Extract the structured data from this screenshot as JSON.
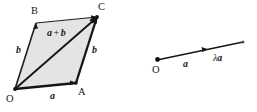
{
  "figure": {
    "colors": {
      "stroke": "#1a1a1a",
      "fill": "#e3e3e3",
      "background": "#ffffff"
    }
  },
  "parallelogram": {
    "name": "parallelogram-OACB",
    "vertices": [
      {
        "label": "O",
        "x": 15,
        "y": 89
      },
      {
        "label": "A",
        "x": 76,
        "y": 83
      },
      {
        "label": "C",
        "x": 97,
        "y": 17
      },
      {
        "label": "B",
        "x": 36,
        "y": 23
      }
    ],
    "vertex_labels": {
      "O": "O",
      "A": "A",
      "B": "B",
      "C": "C"
    },
    "edge_labels": {
      "bottom": "a",
      "left": "b",
      "right": "b",
      "diagonal": "a + b"
    },
    "diagonal_label_parts": {
      "first": "a",
      "operator": "+",
      "second": "b"
    }
  },
  "ray": {
    "name": "scalar-multiple-ray",
    "origin_label": "O",
    "origin": {
      "x": 157,
      "y": 60
    },
    "end": {
      "x": 243,
      "y": 42
    },
    "arrow_tip": {
      "x": 207,
      "y": 50
    },
    "labels": {
      "vector": "a",
      "scaled_prefix": "λ",
      "scaled_vector": "a"
    }
  }
}
